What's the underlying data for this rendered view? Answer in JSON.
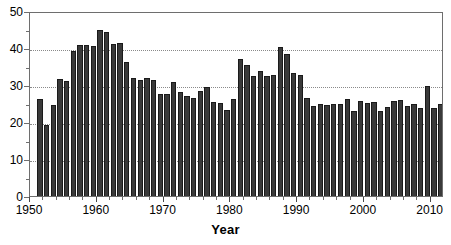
{
  "chart_data": {
    "type": "bar",
    "title": "",
    "xlabel": "Year",
    "ylabel": "",
    "xlim": [
      1950,
      2012
    ],
    "ylim": [
      0,
      50
    ],
    "grid": true,
    "legend": null,
    "bar_color": "#3a3a3a",
    "axis_color": "#6e6e6e",
    "gridline_color": "#8a8a8a",
    "x_tick_labels": [
      "1950",
      "1960",
      "1970",
      "1980",
      "1990",
      "2000",
      "2010"
    ],
    "x_ticks": [
      1950,
      1960,
      1970,
      1980,
      1990,
      2000,
      2010
    ],
    "y_tick_labels": [
      "0",
      "10",
      "20",
      "30",
      "40",
      "50"
    ],
    "y_ticks": [
      0,
      10,
      20,
      30,
      40,
      50
    ],
    "gridlines_y": [
      10,
      20,
      30,
      40
    ],
    "categories": [
      1951,
      1952,
      1953,
      1954,
      1955,
      1956,
      1957,
      1958,
      1959,
      1960,
      1961,
      1962,
      1963,
      1964,
      1965,
      1966,
      1967,
      1968,
      1969,
      1970,
      1971,
      1972,
      1973,
      1974,
      1975,
      1976,
      1977,
      1978,
      1979,
      1980,
      1981,
      1982,
      1983,
      1984,
      1985,
      1986,
      1987,
      1988,
      1989,
      1990,
      1991,
      1992,
      1993,
      1994,
      1995,
      1996,
      1997,
      1998,
      1999,
      2000,
      2001,
      2002,
      2003,
      2004,
      2005,
      2006,
      2007,
      2008,
      2009,
      2010,
      2011
    ],
    "values": [
      26.2,
      19.2,
      24.5,
      31.5,
      31.0,
      39.2,
      40.8,
      40.9,
      40.6,
      44.8,
      44.2,
      41.2,
      41.4,
      36.3,
      31.9,
      31.3,
      31.8,
      31.4,
      27.5,
      27.5,
      30.7,
      28.0,
      26.9,
      26.6,
      28.3,
      29.4,
      25.3,
      25.2,
      23.2,
      26.3,
      37.0,
      35.5,
      32.5,
      33.7,
      32.4,
      32.8,
      40.2,
      38.4,
      33.3,
      32.7,
      26.4,
      24.3,
      25.0,
      24.6,
      25.0,
      24.9,
      26.1,
      23.0,
      25.8,
      25.1,
      25.4,
      22.9,
      24.0,
      25.8,
      25.9,
      24.3,
      25.0,
      23.7,
      29.8,
      23.9,
      24.9
    ]
  }
}
